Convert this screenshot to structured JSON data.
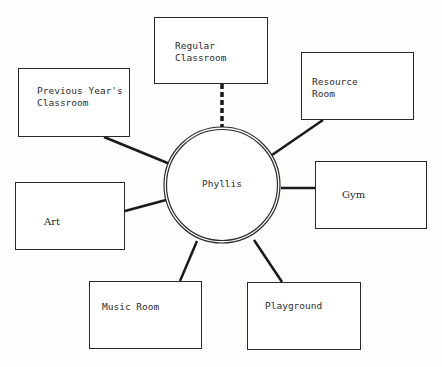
{
  "diagram": {
    "type": "ecomap",
    "center": {
      "label": "Phyllis"
    },
    "nodes": [
      {
        "id": "regular-classroom",
        "line1": "Regular",
        "line2": "Classroom",
        "connection": "dashed"
      },
      {
        "id": "previous-years-classroom",
        "line1": "Previous Year's",
        "line2": "Classroom",
        "connection": "solid"
      },
      {
        "id": "resource-room",
        "line1": "Resource",
        "line2": "Room",
        "connection": "solid"
      },
      {
        "id": "gym",
        "line1": "Gym",
        "line2": "",
        "connection": "solid"
      },
      {
        "id": "art",
        "line1": "Art",
        "line2": "",
        "connection": "solid"
      },
      {
        "id": "music-room",
        "line1": "Music Room",
        "line2": "",
        "connection": "solid"
      },
      {
        "id": "playground",
        "line1": "Playground",
        "line2": "",
        "connection": "solid"
      }
    ],
    "colors": {
      "line": "#1a1a1a",
      "border": "#2a2a2a",
      "background": "#fdfdfc"
    }
  }
}
